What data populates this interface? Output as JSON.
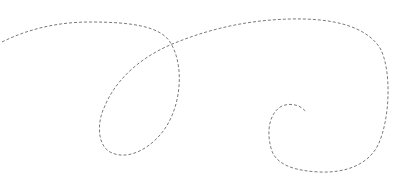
{
  "figure": {
    "background": "#ffffff",
    "stroke_color": "#7a7a7a",
    "stroke_width": 1,
    "dash_pattern": "3 2",
    "path": "M 2 42 C 30 28, 60 22, 90 22 C 130 22, 160 26, 170 42 C 185 65, 182 110, 160 135 C 145 152, 125 160, 110 152 C 96 144, 98 120, 104 108 C 115 80, 140 58, 170 45 C 210 28, 250 20, 290 19 C 330 18, 365 25, 380 48 C 392 70, 390 120, 378 145 C 368 165, 345 173, 320 172 C 295 171, 275 165, 271 148 C 266 130, 270 112, 282 106 C 292 102, 302 106, 306 112"
  }
}
